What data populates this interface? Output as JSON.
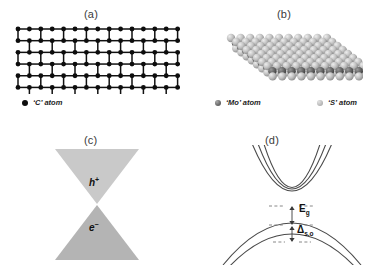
{
  "figure": {
    "panels": [
      {
        "id": "a",
        "label": "(a)",
        "subject": "graphene-lattice",
        "legend": [
          {
            "symbol": "C",
            "text": "‘C’ atom",
            "color": "#0d0d0d",
            "icon": "atom-dot-icon"
          }
        ]
      },
      {
        "id": "b",
        "label": "(b)",
        "subject": "mos2-lattice",
        "legend": [
          {
            "symbol": "Mo",
            "text": "‘Mo’ atom",
            "color": "#6d6d6d",
            "icon": "atom-sphere-icon"
          },
          {
            "symbol": "S",
            "text": "‘S’ atom",
            "color": "#bdbdbd",
            "icon": "atom-sphere-icon"
          }
        ]
      },
      {
        "id": "c",
        "label": "(c)",
        "subject": "dirac-cone",
        "carriers": [
          {
            "name": "hole",
            "symbol": "h",
            "charge": "+",
            "position": "upper-cone"
          },
          {
            "name": "electron",
            "symbol": "e",
            "charge": "−",
            "position": "lower-cone"
          }
        ],
        "colors": {
          "upper_cone": "#c9c9c9",
          "lower_cone": "#b4b4b4"
        }
      },
      {
        "id": "d",
        "label": "(d)",
        "subject": "mos2-band-structure",
        "annotations": [
          {
            "name": "band-gap",
            "symbol": "E",
            "subscript": "g"
          },
          {
            "name": "spin-orbit-splitting",
            "symbol": "Δ",
            "subscript": "s.o"
          }
        ]
      }
    ]
  },
  "chart_data": {
    "type": "line",
    "xlabel": "",
    "ylabel": "",
    "grid": false,
    "legend_position": "none",
    "series": [
      {
        "name": "conduction-band-1",
        "shape": "parabola-up",
        "vertex": [
          0,
          0
        ],
        "curvature": 1.0
      },
      {
        "name": "conduction-band-2",
        "shape": "parabola-up",
        "vertex": [
          0,
          0
        ],
        "curvature": 1.12
      },
      {
        "name": "valence-band-upper",
        "shape": "parabola-down",
        "vertex": [
          0,
          -1
        ],
        "curvature": 1.0
      },
      {
        "name": "valence-band-lower",
        "shape": "parabola-down",
        "vertex": [
          0,
          -1.45
        ],
        "curvature": 1.0
      }
    ],
    "annotations": [
      {
        "label": "E_g",
        "type": "double-arrow",
        "between": [
          "conduction-band-minimum",
          "valence-band-maximum"
        ]
      },
      {
        "label": "Δ_s.o",
        "type": "double-arrow",
        "between": [
          "valence-band-upper",
          "valence-band-lower"
        ]
      }
    ]
  }
}
